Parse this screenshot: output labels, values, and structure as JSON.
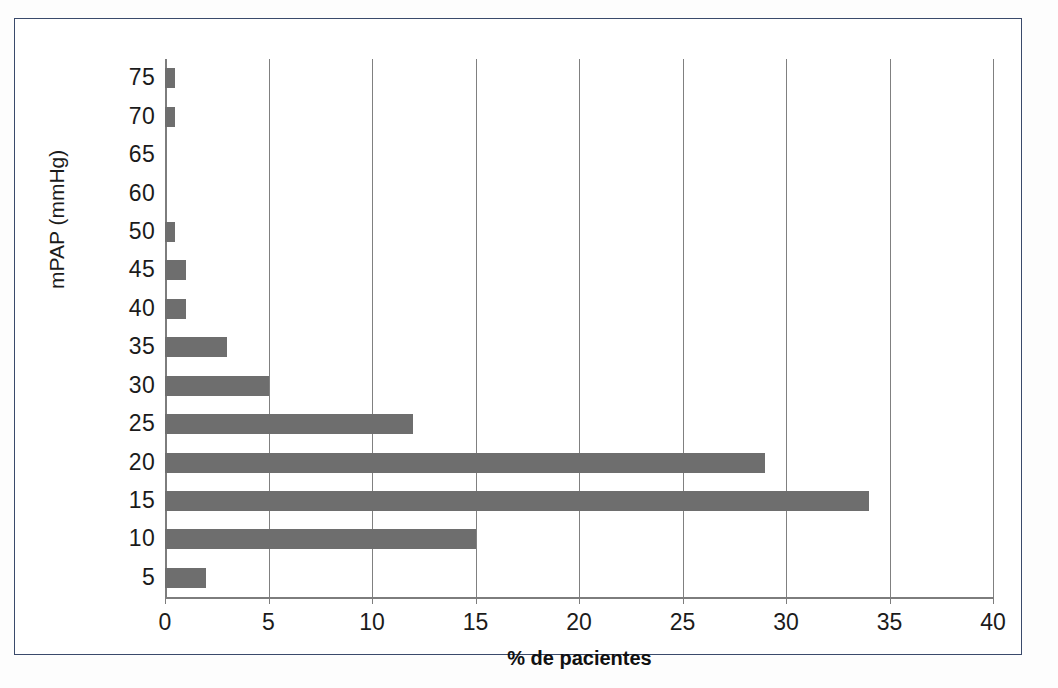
{
  "figure": {
    "border_color": "#3a4a6b",
    "background": "#ffffff"
  },
  "chart_data": {
    "type": "bar",
    "orientation": "horizontal",
    "title": "",
    "subtitle": "",
    "xlabel": "% de pacientes",
    "ylabel": "mPAP (mmHg)",
    "categories": [
      "5",
      "10",
      "15",
      "20",
      "25",
      "30",
      "35",
      "40",
      "45",
      "50",
      "60",
      "65",
      "70",
      "75"
    ],
    "values": [
      2,
      15,
      34,
      29,
      12,
      5,
      3,
      1,
      1,
      0.5,
      0,
      0,
      0.5,
      0.5
    ],
    "xlim": [
      0,
      40
    ],
    "xticks": [
      0,
      5,
      10,
      15,
      20,
      25,
      30,
      35,
      40
    ],
    "xtick_labels": [
      "0",
      "5",
      "10",
      "15",
      "20",
      "25",
      "30",
      "35",
      "40"
    ],
    "ytick_labels_top_to_bottom": [
      "75",
      "70",
      "65",
      "60",
      "50",
      "45",
      "40",
      "35",
      "30",
      "25",
      "20",
      "15",
      "10",
      "5"
    ],
    "grid": "vertical",
    "legend": "none",
    "bar_color": "#6e6e6e",
    "axis_color": "#808080"
  }
}
